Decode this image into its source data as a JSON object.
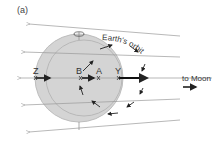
{
  "figure": {
    "panel_label": "(a)",
    "orbit_label": "Earth's orbit",
    "moon_label": "to Moon",
    "points": [
      {
        "id": "Z",
        "label": "Z"
      },
      {
        "id": "B",
        "label": "B"
      },
      {
        "id": "A",
        "label": "A"
      },
      {
        "id": "Y",
        "label": "Y"
      }
    ],
    "colors": {
      "earth_fill": "#d4d4d4",
      "earth_outline": "#b0b0b0",
      "lines": "#888888",
      "arrows": "#222222"
    }
  }
}
